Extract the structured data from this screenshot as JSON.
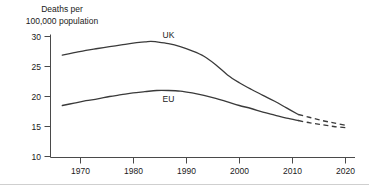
{
  "chart_data": {
    "type": "line",
    "title": "",
    "ylabel": "Deaths per 100,000 population",
    "ylabel_line1": "Deaths per",
    "ylabel_line2": "100,000 population",
    "xlabel": "",
    "xlim": [
      1965,
      2020
    ],
    "ylim": [
      10,
      30
    ],
    "yticks": [
      10,
      15,
      20,
      25,
      30
    ],
    "ytick_labels": [
      "10",
      "15",
      "20",
      "25",
      "30"
    ],
    "xticks": [
      1970,
      1980,
      1990,
      2000,
      2010,
      2020
    ],
    "xtick_labels": [
      "1970",
      "1980",
      "1990",
      "2000",
      "2010",
      "2020"
    ],
    "grid": false,
    "legend_position": "inline-annotations",
    "line_color": "#3a3a3a",
    "axis_color": "#4a4a4a",
    "series": [
      {
        "name": "UK",
        "label": "UK",
        "label_x": 1990,
        "label_y": 29.8,
        "style": "solid",
        "x": [
          1972,
          1974,
          1976,
          1978,
          1980,
          1982,
          1984,
          1986,
          1987,
          1988,
          1990,
          1992,
          1994,
          1996,
          1998,
          2000,
          2002,
          2004,
          2006,
          2008,
          2010,
          2012
        ],
        "values": [
          26.9,
          27.3,
          27.7,
          28.0,
          28.3,
          28.6,
          28.9,
          29.1,
          29.2,
          29.1,
          28.8,
          28.3,
          27.6,
          26.7,
          25.3,
          23.6,
          22.3,
          21.2,
          20.2,
          19.2,
          18.1,
          17.0
        ]
      },
      {
        "name": "UK projection",
        "label": "",
        "style": "dashed",
        "x": [
          2012,
          2014,
          2016,
          2018,
          2020
        ],
        "values": [
          17.0,
          16.5,
          16.0,
          15.6,
          15.2
        ]
      },
      {
        "name": "EU",
        "label": "EU",
        "label_x": 1990,
        "label_y": 19.1,
        "style": "solid",
        "x": [
          1972,
          1974,
          1976,
          1978,
          1980,
          1982,
          1984,
          1986,
          1988,
          1990,
          1992,
          1994,
          1996,
          1998,
          2000,
          2002,
          2004,
          2006,
          2008,
          2010,
          2012
        ],
        "values": [
          18.5,
          18.9,
          19.3,
          19.6,
          20.0,
          20.3,
          20.6,
          20.8,
          21.0,
          21.0,
          20.9,
          20.6,
          20.2,
          19.7,
          19.1,
          18.5,
          18.0,
          17.4,
          16.9,
          16.4,
          16.0
        ]
      },
      {
        "name": "EU projection",
        "label": "",
        "style": "dashed",
        "x": [
          2012,
          2014,
          2016,
          2018,
          2020
        ],
        "values": [
          16.0,
          15.6,
          15.3,
          15.0,
          14.8
        ]
      }
    ]
  }
}
